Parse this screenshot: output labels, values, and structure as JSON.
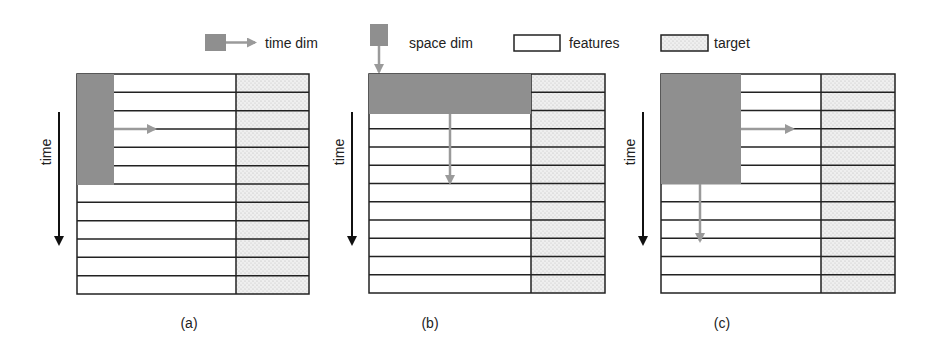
{
  "legend": {
    "time_dim": "time dim",
    "space_dim": "space dim",
    "features": "features",
    "target": "target"
  },
  "colors": {
    "window": "#8f8f8f",
    "arrow": "#9a9a9a",
    "grid_line": "#222222",
    "target_fill": "#ececec"
  },
  "axis_label": "time",
  "panels": [
    {
      "caption": "(a)",
      "description": "time-dim window: narrow column over first 6 time steps, arrow sliding right"
    },
    {
      "caption": "(b)",
      "description": "space-dim window: full feature width over first 2 time steps, arrow sliding down"
    },
    {
      "caption": "(c)",
      "description": "combined window: wide block over first 6 time steps, arrows sliding right and down"
    }
  ],
  "grid": {
    "rows": 12
  }
}
